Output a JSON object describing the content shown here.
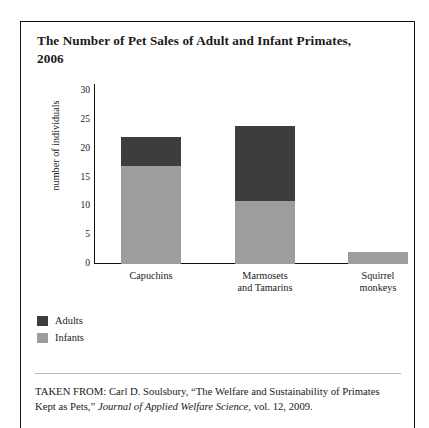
{
  "figure": {
    "title": "The Number of Pet Sales of Adult and Infant Primates, 2006",
    "source_prefix": "TAKEN FROM: Carl D. Soulsbury, “The Welfare and Sustainability of Primates Kept as Pets,” ",
    "source_journal": "Journal of Applied Welfare Science",
    "source_suffix": ", vol. 12, 2009."
  },
  "legend": {
    "position": "below-plot-left",
    "items": [
      {
        "label": "Adults",
        "color": "#3d3d3d",
        "swatch": "legend-swatch-adults"
      },
      {
        "label": "Infants",
        "color": "#9d9d9d",
        "swatch": "legend-swatch-infants"
      }
    ]
  },
  "chart_data": {
    "type": "bar",
    "stacked": true,
    "title": "The Number of Pet Sales of Adult and Infant Primates, 2006",
    "xlabel": "",
    "ylabel": "number of individuals",
    "ylim": [
      0,
      30
    ],
    "yticks": [
      0,
      5,
      10,
      15,
      20,
      25,
      30
    ],
    "ytick_labels": [
      "0",
      "5",
      "10",
      "15",
      "20",
      "25",
      "30"
    ],
    "grid": false,
    "categories": [
      "Capuchins",
      "Marmosets and Tamarins",
      "Squirrel monkeys"
    ],
    "series": [
      {
        "name": "Infants",
        "color": "#9d9d9d",
        "values": [
          17,
          11,
          2
        ]
      },
      {
        "name": "Adults",
        "color": "#3d3d3d",
        "values": [
          5,
          13,
          0
        ]
      }
    ],
    "totals": [
      22,
      24,
      2
    ]
  }
}
